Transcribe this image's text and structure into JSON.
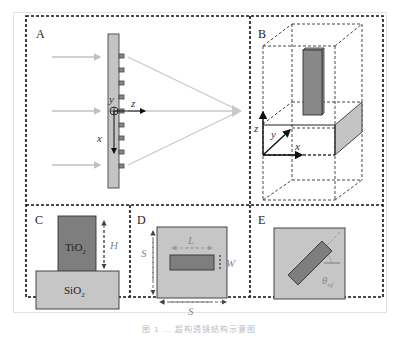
{
  "figure": {
    "panels": {
      "A": {
        "label": "A",
        "axes": {
          "x": "x",
          "y": "y",
          "z": "z"
        }
      },
      "B": {
        "label": "B",
        "axes": {
          "x": "x",
          "y": "y",
          "z": "z"
        }
      },
      "C": {
        "label": "C",
        "top_material": "TiO",
        "top_sub": "2",
        "bottom_material": "SiO",
        "bottom_sub": "2",
        "height_label": "H"
      },
      "D": {
        "label": "D",
        "period_label": "S",
        "length_label": "L",
        "width_label": "W"
      },
      "E": {
        "label": "E",
        "angle_label": "θ",
        "angle_sub": "nf"
      }
    },
    "colors": {
      "dark_pillar": "#7a7a7a",
      "light_substrate": "#c8c8c8",
      "arrow_gray": "#c0c0c0",
      "dashed_border": "#111111"
    },
    "caption": "图 1   …   超构透镜结构示意图"
  }
}
